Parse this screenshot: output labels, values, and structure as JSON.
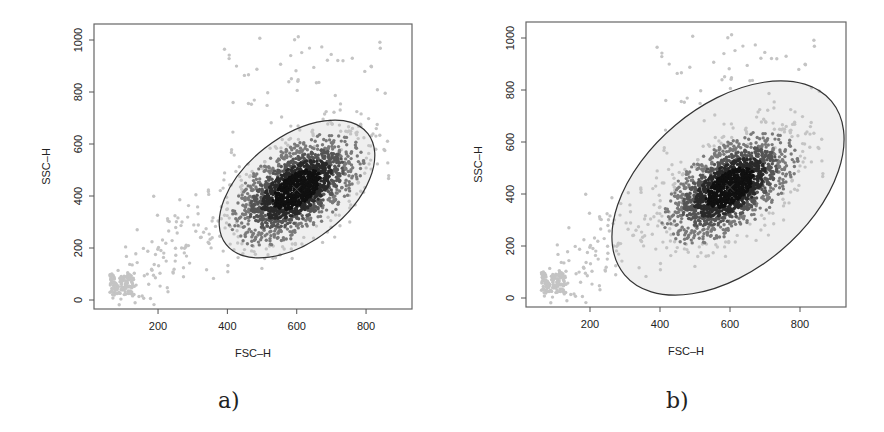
{
  "figure": {
    "panels": [
      {
        "id": "a",
        "caption": "a)",
        "xlabel": "FSC–H",
        "ylabel": "SSC–H"
      },
      {
        "id": "b",
        "caption": "b)",
        "xlabel": "FSC–H",
        "ylabel": "SSC–H"
      }
    ]
  },
  "chart_data": [
    {
      "type": "scatter",
      "title": "",
      "panel_label": "a)",
      "xlabel": "FSC–H",
      "ylabel": "SSC–H",
      "xlim": [
        50,
        930
      ],
      "ylim": [
        -30,
        1060
      ],
      "x_ticks": [
        200,
        400,
        600,
        800
      ],
      "y_ticks": [
        0,
        200,
        400,
        600,
        800,
        1000
      ],
      "grid": false,
      "legend": null,
      "series": [
        {
          "name": "main population",
          "center": [
            600,
            425
          ],
          "sd": [
            85,
            95
          ],
          "correlation": 0.55,
          "approx_points": 1800,
          "color": "#1a1a1a"
        },
        {
          "name": "debris cluster",
          "center": [
            80,
            60
          ],
          "approx_points": 120,
          "color": "#cfcfcf"
        },
        {
          "name": "scattered outliers",
          "approx_points": 250,
          "color": "#bdbdbd"
        }
      ],
      "annotations": [
        {
          "type": "ellipse",
          "center": [
            600,
            425
          ],
          "x_extent": [
            385,
            810
          ],
          "y_extent": [
            150,
            700
          ],
          "rotation_deg": 40,
          "fill": "#efefef",
          "stroke": "#333333"
        },
        {
          "type": "center-marker",
          "symbol": "x",
          "at": [
            600,
            425
          ]
        }
      ]
    },
    {
      "type": "scatter",
      "title": "",
      "panel_label": "b)",
      "xlabel": "FSC–H",
      "ylabel": "SSC–H",
      "xlim": [
        50,
        930
      ],
      "ylim": [
        -30,
        1060
      ],
      "x_ticks": [
        200,
        400,
        600,
        800
      ],
      "y_ticks": [
        0,
        200,
        400,
        600,
        800,
        1000
      ],
      "grid": false,
      "legend": null,
      "series": [
        {
          "name": "main population",
          "center": [
            600,
            425
          ],
          "sd": [
            85,
            95
          ],
          "correlation": 0.55,
          "approx_points": 1800,
          "color": "#1a1a1a"
        },
        {
          "name": "debris cluster",
          "center": [
            80,
            60
          ],
          "approx_points": 120,
          "color": "#cfcfcf"
        },
        {
          "name": "scattered outliers",
          "approx_points": 250,
          "color": "#bdbdbd"
        }
      ],
      "annotations": [
        {
          "type": "ellipse",
          "center": [
            605,
            425
          ],
          "x_extent": [
            270,
            940
          ],
          "y_extent": [
            15,
            835
          ],
          "rotation_deg": 40,
          "fill": "#efefef",
          "stroke": "#333333"
        },
        {
          "type": "center-marker",
          "symbol": "x",
          "at": [
            600,
            425
          ]
        }
      ]
    }
  ],
  "layout": {
    "panels": [
      {
        "frame": [
          94,
          24,
          412,
          309
        ],
        "x_px_per_unit": 0.3467,
        "x0_px": 88.7,
        "y_px_per_unit": 0.26,
        "y0_px": 300,
        "ellipse_px": {
          "cx": 297,
          "cy": 189,
          "rx": 90,
          "ry": 52,
          "rot": -38
        }
      },
      {
        "frame": [
          526,
          22,
          846,
          307
        ],
        "x_px_per_unit": 0.35,
        "x0_px": 520,
        "y_px_per_unit": 0.26,
        "y0_px": 298,
        "ellipse_px": {
          "cx": 728,
          "cy": 188,
          "rx": 135,
          "ry": 82,
          "rot": -40
        }
      }
    ]
  }
}
